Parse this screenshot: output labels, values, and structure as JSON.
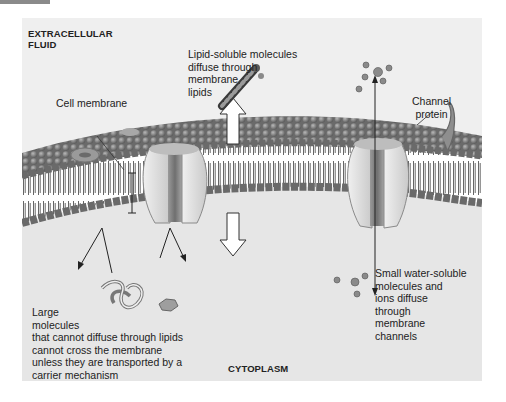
{
  "figure": {
    "regions": {
      "extracellular": "EXTRACELLULAR\nFLUID",
      "extracellular_line1": "EXTRACELLULAR",
      "extracellular_line2": "FLUID",
      "cytoplasm": "CYTOPLASM"
    },
    "labels": {
      "cell_membrane": "Cell membrane",
      "lipid_soluble": [
        "Lipid-soluble molecules",
        "diffuse through",
        "membrane",
        "lipids"
      ],
      "channel_protein": [
        "Channel",
        "protein"
      ],
      "small_water_soluble": [
        "Small water-soluble",
        "molecules and",
        "ions diffuse",
        "through",
        "membrane",
        "channels"
      ],
      "large_molecules": [
        "Large",
        "molecules",
        "that cannot diffuse through lipids",
        "cannot cross the membrane",
        "unless they are transported by a",
        "carrier mechanism"
      ]
    },
    "icons": {
      "up_arrow": "double-arrow-up",
      "down_arrow": "double-arrow-down",
      "lipid_molecule": "lipid-chain-icon",
      "ion": "ion-sphere-icon",
      "protein_channel": "channel-protein-icon",
      "large_molecule": "tangled-protein-icon"
    },
    "colors": {
      "panel_bg": "#e6e6e6",
      "panel_top": "#efefef",
      "head_dark": "#6e6e6e",
      "head_light": "#a9a9a9",
      "tail": "#5a5a5a",
      "protein_light": "#e2e2e2",
      "protein_dark": "#8c8c8c"
    }
  }
}
